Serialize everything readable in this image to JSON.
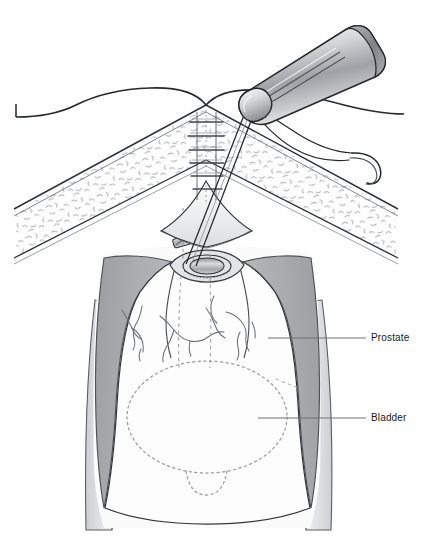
{
  "figure": {
    "kind": "medical-illustration",
    "background_color": "#ffffff",
    "ink_color": "#231f20",
    "width": 435,
    "height": 558
  },
  "labels": [
    {
      "id": "prostate",
      "text": "Prostate",
      "text_x": 371,
      "text_y": 333,
      "leader_line": {
        "x1": 268,
        "y1": 338,
        "x2": 366,
        "y2": 338
      }
    },
    {
      "id": "bladder",
      "text": "Bladder",
      "text_x": 371,
      "text_y": 413,
      "leader_line": {
        "x1": 258,
        "y1": 418,
        "x2": 366,
        "y2": 418
      }
    }
  ],
  "colors": {
    "outline": "#231f20",
    "fat_stipple": "#8d8f92",
    "muscle_shade": "#a9abae",
    "muscle_shade_light": "#c9cbcd",
    "tissue_light": "#f4f4f5",
    "instrument_light": "#fbfbfb",
    "instrument_mid": "#c2c4c7",
    "instrument_dark": "#84878b",
    "urethra_fill": "#b9bbbe",
    "dashed_line": "#9a9ca0",
    "leader_line": "#6e7174",
    "label_text": "#1a1a1a"
  },
  "anatomy": {
    "structures": [
      "abdominal skin flap",
      "subcutaneous fat layer",
      "midline incision with interrupted sutures",
      "retracted peritoneal window",
      "levator / pelvic sidewall musculature",
      "prostatic fossa with vessels",
      "urethral stump (oval opening)",
      "surgical clip",
      "bladder (dashed outline)",
      "thighs"
    ],
    "suture_count": 6
  },
  "instrument": {
    "name": "knot pusher / suture guide",
    "has_threads": true,
    "thread_count": 2,
    "needle": "curved surgical needle"
  }
}
